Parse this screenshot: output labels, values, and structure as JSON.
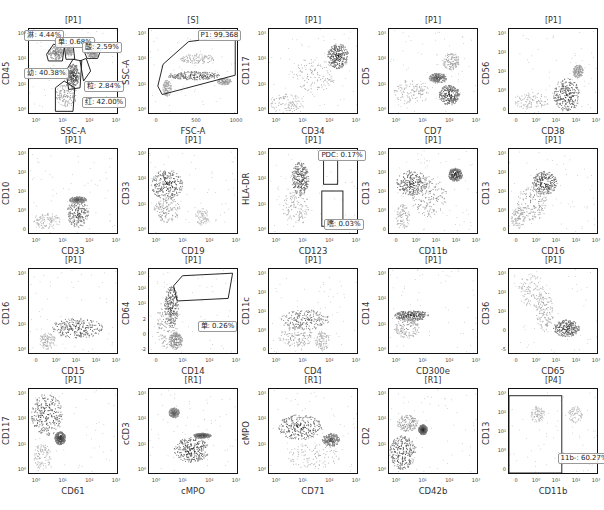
{
  "figure": {
    "layout": {
      "columns": 5,
      "rows": 4
    },
    "colors": {
      "axis": "#111111",
      "dense": "#111111",
      "mid": "#666666",
      "light": "#bbbbbb",
      "gate": "#222222"
    }
  },
  "chart_data": [
    {
      "type": "scatter",
      "title": "[P1]",
      "xlabel": "SSC-A",
      "ylabel": "CD45",
      "xticks": [
        "10⁰",
        "10¹",
        "10²",
        "10³"
      ],
      "yticks": [
        "10³",
        "10²",
        "10¹",
        "10⁰"
      ],
      "gates": [
        {
          "name": "淋",
          "value": "4.44%"
        },
        {
          "name": "单",
          "value": "0.68%"
        },
        {
          "name": "酸",
          "value": "2.59%"
        },
        {
          "name": "幼",
          "value": "40.38%"
        },
        {
          "name": "粒",
          "value": "2.84%"
        },
        {
          "name": "红",
          "value": "42.00%"
        }
      ]
    },
    {
      "type": "scatter",
      "title": "[S]",
      "xlabel": "FSC-A",
      "ylabel": "SSC-A",
      "xticks": [
        "0",
        "500",
        "1000"
      ],
      "yticks": [
        "10³",
        "10²",
        "10¹",
        "10⁰"
      ],
      "gates": [
        {
          "name": "P1",
          "value": "99.368"
        }
      ]
    },
    {
      "type": "scatter",
      "title": "[P1]",
      "xlabel": "CD34",
      "ylabel": "CD117",
      "xticks": [
        "10⁰",
        "10¹",
        "10²",
        "10³"
      ],
      "yticks": [
        "10³",
        "10²",
        "10¹",
        "10⁰"
      ],
      "gates": []
    },
    {
      "type": "scatter",
      "title": "[P1]",
      "xlabel": "CD7",
      "ylabel": "CD5",
      "xticks": [
        "10⁰",
        "10¹",
        "10²",
        "10³"
      ],
      "yticks": [
        "10³",
        "10²",
        "10¹",
        "10⁰"
      ],
      "gates": []
    },
    {
      "type": "scatter",
      "title": "[P1]",
      "xlabel": "CD38",
      "ylabel": "CD56",
      "xticks": [
        "0",
        "10⁰",
        "10¹",
        "10²",
        "10³"
      ],
      "yticks": [
        "10³",
        "10²",
        "10¹",
        "10⁰",
        "0"
      ],
      "gates": []
    },
    {
      "type": "scatter",
      "title": "[P1]",
      "xlabel": "CD33",
      "ylabel": "CD10",
      "xticks": [
        "10⁰",
        "10¹",
        "10²",
        "10³"
      ],
      "yticks": [
        "10³",
        "10²",
        "10¹",
        "10⁰",
        "0"
      ],
      "gates": []
    },
    {
      "type": "scatter",
      "title": "[P1]",
      "xlabel": "CD19",
      "ylabel": "CD33",
      "xticks": [
        "10⁰",
        "10¹",
        "10²",
        "10³"
      ],
      "yticks": [
        "10³",
        "10²",
        "10¹",
        "10⁰"
      ],
      "gates": []
    },
    {
      "type": "scatter",
      "title": "[P1]",
      "xlabel": "CD123",
      "ylabel": "HLA-DR",
      "xticks": [
        "10⁰",
        "10¹",
        "10²",
        "10³"
      ],
      "yticks": [
        "10³",
        "10²",
        "10¹",
        "10⁰"
      ],
      "gates": [
        {
          "name": "PDC",
          "value": "0.17%"
        },
        {
          "name": "嗜",
          "value": "0.03%"
        }
      ]
    },
    {
      "type": "scatter",
      "title": "[P1]",
      "xlabel": "CD11b",
      "ylabel": "CD13",
      "xticks": [
        "0",
        "10⁰",
        "10¹",
        "10²",
        "10³"
      ],
      "yticks": [
        "10³",
        "10²",
        "10¹",
        "10⁰",
        "0"
      ],
      "gates": []
    },
    {
      "type": "scatter",
      "title": "[P1]",
      "xlabel": "CD16",
      "ylabel": "CD13",
      "xticks": [
        "0",
        "10⁰",
        "10¹",
        "10²",
        "10³"
      ],
      "yticks": [
        "10³",
        "10²",
        "10¹",
        "10⁰",
        "0"
      ],
      "gates": []
    },
    {
      "type": "scatter",
      "title": "[P1]",
      "xlabel": "CD15",
      "ylabel": "CD16",
      "xticks": [
        "0",
        "10⁰",
        "10¹",
        "10²",
        "10³"
      ],
      "yticks": [
        "10³",
        "10²",
        "10¹",
        "10⁰"
      ],
      "gates": []
    },
    {
      "type": "scatter",
      "title": "[P1]",
      "xlabel": "CD14",
      "ylabel": "CD64",
      "xticks": [
        "0",
        "10¹",
        "10²",
        "10³"
      ],
      "yticks": [
        "10³",
        "10²",
        "10¹",
        "2",
        "0",
        "-2"
      ],
      "gates": [
        {
          "name": "单",
          "value": "0.26%"
        }
      ]
    },
    {
      "type": "scatter",
      "title": "[P1]",
      "xlabel": "CD4",
      "ylabel": "CD11c",
      "xticks": [
        "10⁰",
        "10¹",
        "10²",
        "10³"
      ],
      "yticks": [
        "10³",
        "10²",
        "10¹",
        "10⁰",
        "0"
      ],
      "gates": []
    },
    {
      "type": "scatter",
      "title": "[P1]",
      "xlabel": "CD300e",
      "ylabel": "CD14",
      "xticks": [
        "10⁰",
        "10¹",
        "10²",
        "10³"
      ],
      "yticks": [
        "10³",
        "10²",
        "10¹",
        "10⁰"
      ],
      "gates": []
    },
    {
      "type": "scatter",
      "title": "[P1]",
      "xlabel": "CD65",
      "ylabel": "CD36",
      "xticks": [
        "0",
        "10⁰",
        "10¹",
        "10²",
        "10³"
      ],
      "yticks": [
        "10³",
        "10²",
        "10¹",
        "0",
        "-5"
      ],
      "gates": []
    },
    {
      "type": "scatter",
      "title": "[P1]",
      "xlabel": "CD61",
      "ylabel": "CD117",
      "xticks": [
        "10⁰",
        "10¹",
        "10²",
        "10³"
      ],
      "yticks": [
        "10³",
        "10²",
        "10¹",
        "10⁰"
      ],
      "gates": []
    },
    {
      "type": "scatter",
      "title": "[R1]",
      "xlabel": "cMPO",
      "ylabel": "cCD3",
      "xticks": [
        "10⁰",
        "10¹",
        "10²",
        "10³"
      ],
      "yticks": [
        "10³",
        "10²",
        "10¹",
        "10⁰"
      ],
      "gates": []
    },
    {
      "type": "scatter",
      "title": "[R1]",
      "xlabel": "CD71",
      "ylabel": "cMPO",
      "xticks": [
        "10⁰",
        "10¹",
        "10²",
        "10³"
      ],
      "yticks": [
        "10³",
        "10²",
        "10¹",
        "10⁰"
      ],
      "gates": []
    },
    {
      "type": "scatter",
      "title": "[R1]",
      "xlabel": "CD42b",
      "ylabel": "CD2",
      "xticks": [
        "10⁰",
        "10¹",
        "10²",
        "10³"
      ],
      "yticks": [
        "10³",
        "10²",
        "10¹",
        "10⁰"
      ],
      "gates": []
    },
    {
      "type": "scatter",
      "title": "[P4]",
      "xlabel": "CD11b",
      "ylabel": "CD13",
      "xticks": [
        "0",
        "10⁰",
        "10¹",
        "10²",
        "10³"
      ],
      "yticks": [
        "10³",
        "10²",
        "10¹",
        "10⁰",
        "0"
      ],
      "gates": [
        {
          "name": "11b-",
          "value": "60.27%"
        }
      ]
    }
  ],
  "gate_text": {
    "p0_lin": "淋: 4.44%",
    "p0_dan": "单: 0.68%",
    "p0_suan": "酸: 2.59%",
    "p0_you": "幼: 40.38%",
    "p0_li": "粒: 2.84%",
    "p0_hong": "红: 42.00%",
    "p1": "P1: 99.368",
    "p7_pdc": "PDC: 0.17%",
    "p7_shi": "嗜: 0.03%",
    "p11": "单: 0.26%",
    "p19": "11b-: 60.27%"
  }
}
